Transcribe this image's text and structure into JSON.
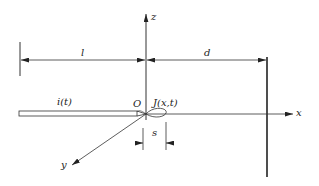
{
  "diagram": {
    "axes": {
      "x_label": "x",
      "y_label": "y",
      "z_label": "z"
    },
    "labels": {
      "length_l": "l",
      "distance_d": "d",
      "current": "i(t)",
      "origin": "O",
      "current_density": "J(x,t)",
      "offset_s": "s"
    },
    "colors": {
      "line": "#333333",
      "background": "#ffffff"
    }
  }
}
